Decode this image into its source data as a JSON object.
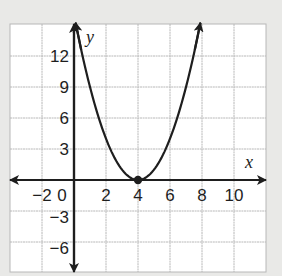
{
  "chart_data": {
    "type": "line",
    "title": "",
    "function": "y = (x - 4)^2",
    "xlabel": "x",
    "ylabel": "y",
    "xlim": [
      -4,
      12
    ],
    "ylim": [
      -9,
      15
    ],
    "grid": true,
    "x_ticks": [
      {
        "value": -2,
        "label": "−2"
      },
      {
        "value": 0,
        "label": "0"
      },
      {
        "value": 2,
        "label": "2"
      },
      {
        "value": 4,
        "label": "4"
      },
      {
        "value": 6,
        "label": "6"
      },
      {
        "value": 8,
        "label": "8"
      },
      {
        "value": 10,
        "label": "10"
      }
    ],
    "y_ticks": [
      {
        "value": 12,
        "label": "12"
      },
      {
        "value": 9,
        "label": "9"
      },
      {
        "value": 6,
        "label": "6"
      },
      {
        "value": 3,
        "label": "3"
      },
      {
        "value": -3,
        "label": "−3"
      },
      {
        "value": -6,
        "label": "−6"
      }
    ],
    "series": [
      {
        "name": "parabola",
        "x": [
          0.1,
          1,
          2,
          3,
          4,
          5,
          6,
          7,
          7.9
        ],
        "y": [
          15.2,
          9,
          4,
          1,
          0,
          1,
          4,
          9,
          15.2
        ]
      }
    ],
    "points": [
      {
        "label": "vertex",
        "x": 4,
        "y": 0
      }
    ],
    "colors": {
      "background": "#e9e9e7",
      "plot_area": "#ffffff",
      "grid": "#b8b8b8",
      "ink": "#1e1e1e"
    }
  }
}
